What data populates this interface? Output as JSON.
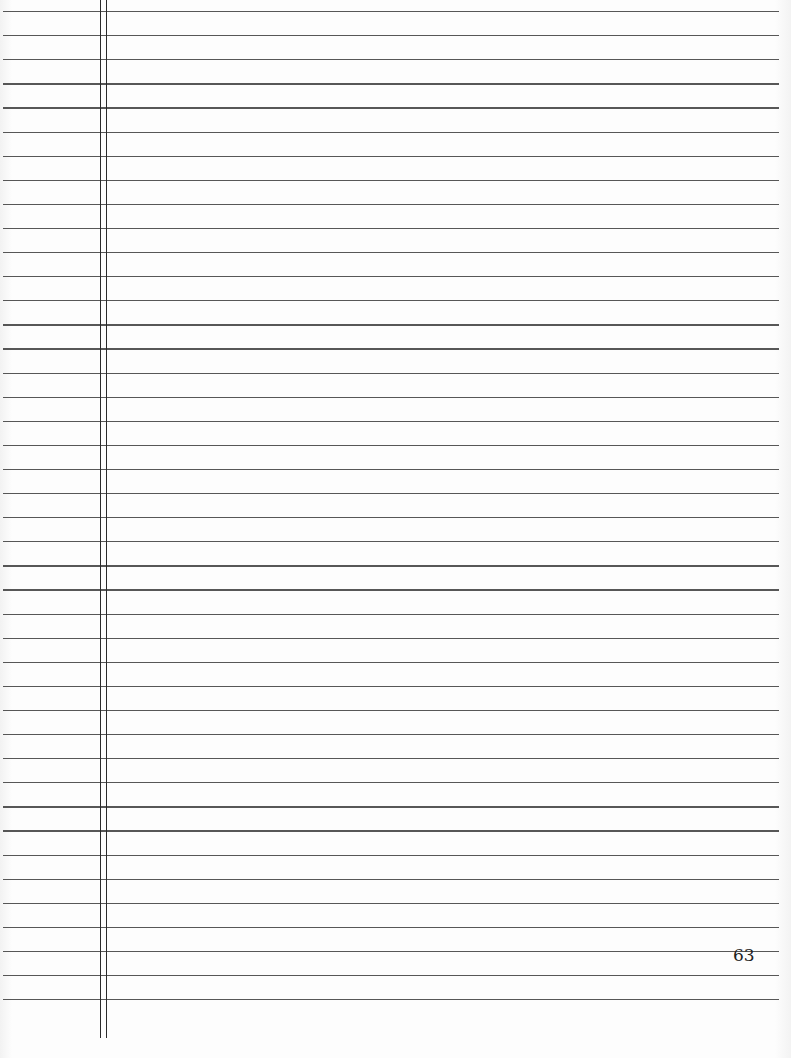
{
  "page": {
    "page_number": "63",
    "ruled_line_count": 42,
    "ruled_line_start_y": 11,
    "ruled_line_spacing": 24.1,
    "margin_lines_x": [
      100,
      106
    ],
    "line_color": "#3a3a3a",
    "paper_color": "#fcfcfc"
  }
}
